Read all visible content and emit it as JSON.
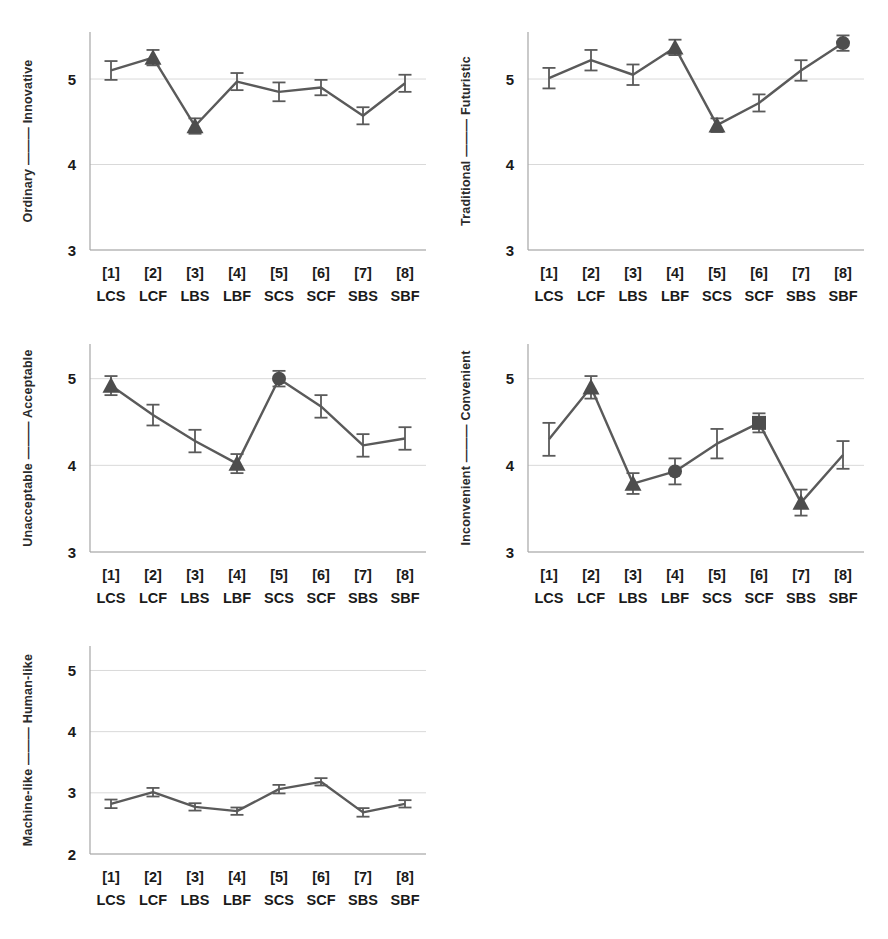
{
  "figure": {
    "title": "",
    "panel_count": 5,
    "accent_color": "#5a5a5a",
    "marker_color": "#4d4d4d",
    "grid_color": "#d9d9d9"
  },
  "conditions": {
    "indices": [
      "[1]",
      "[2]",
      "[3]",
      "[4]",
      "[5]",
      "[6]",
      "[7]",
      "[8]"
    ],
    "codes": [
      "LCS",
      "LCF",
      "LBS",
      "LBF",
      "SCS",
      "SCF",
      "SBS",
      "SBF"
    ]
  },
  "chart_data": [
    {
      "id": "panel-ordinary-innovative",
      "type": "line",
      "title": "",
      "ylabel": "Ordinary ——— Innovative",
      "ylabel_left": "Ordinary",
      "ylabel_right": "Innovative",
      "xlabel": "",
      "categories": [
        "[1] LCS",
        "[2] LCF",
        "[3] LBS",
        "[4] LBF",
        "[5] SCS",
        "[6] SCF",
        "[7] SBS",
        "[8] SBF"
      ],
      "values": [
        5.1,
        5.25,
        4.45,
        4.97,
        4.85,
        4.9,
        4.57,
        4.95
      ],
      "errors": [
        0.11,
        0.09,
        0.09,
        0.1,
        0.11,
        0.09,
        0.1,
        0.1
      ],
      "markers": [
        "none",
        "triangle",
        "triangle",
        "none",
        "none",
        "none",
        "none",
        "none"
      ],
      "ylim": [
        3,
        5.55
      ],
      "yticks": [
        3,
        4,
        5
      ],
      "ytick_labels": [
        "3",
        "4",
        "5"
      ],
      "grid": true,
      "legend": "none"
    },
    {
      "id": "panel-traditional-futuristic",
      "type": "line",
      "title": "",
      "ylabel": "Traditional ——— Futuristic",
      "ylabel_left": "Traditional",
      "ylabel_right": "Futuristic",
      "xlabel": "",
      "categories": [
        "[1] LCS",
        "[2] LCF",
        "[3] LBS",
        "[4] LBF",
        "[5] SCS",
        "[6] SCF",
        "[7] SBS",
        "[8] SBF"
      ],
      "values": [
        5.01,
        5.22,
        5.05,
        5.37,
        4.46,
        4.72,
        5.1,
        5.42
      ],
      "errors": [
        0.12,
        0.12,
        0.12,
        0.09,
        0.08,
        0.1,
        0.12,
        0.09
      ],
      "markers": [
        "none",
        "none",
        "none",
        "triangle",
        "triangle",
        "none",
        "none",
        "circle"
      ],
      "ylim": [
        3,
        5.55
      ],
      "yticks": [
        3,
        4,
        5
      ],
      "ytick_labels": [
        "3",
        "4",
        "5"
      ],
      "grid": true,
      "legend": "none"
    },
    {
      "id": "panel-unacceptable-acceptable",
      "type": "line",
      "title": "",
      "ylabel": "Unacceptable ——— Acceptable",
      "ylabel_left": "Unacceptable",
      "ylabel_right": "Acceptable",
      "xlabel": "",
      "categories": [
        "[1] LCS",
        "[2] LCF",
        "[3] LBS",
        "[4] LBF",
        "[5] SCS",
        "[6] SCF",
        "[7] SBS",
        "[8] SBF"
      ],
      "values": [
        4.92,
        4.58,
        4.28,
        4.02,
        5.0,
        4.68,
        4.23,
        4.31
      ],
      "errors": [
        0.11,
        0.12,
        0.13,
        0.11,
        0.09,
        0.13,
        0.13,
        0.13
      ],
      "markers": [
        "triangle",
        "none",
        "none",
        "triangle",
        "circle",
        "none",
        "none",
        "none"
      ],
      "ylim": [
        3,
        5.4
      ],
      "yticks": [
        3,
        4,
        5
      ],
      "ytick_labels": [
        "3",
        "4",
        "5"
      ],
      "grid": true,
      "legend": "none"
    },
    {
      "id": "panel-inconvenient-convenient",
      "type": "line",
      "title": "",
      "ylabel": "Inconvenient ——— Convenient",
      "ylabel_left": "Inconvenient",
      "ylabel_right": "Convenient",
      "xlabel": "",
      "categories": [
        "[1] LCS",
        "[2] LCF",
        "[3] LBS",
        "[4] LBF",
        "[5] SCS",
        "[6] SCF",
        "[7] SBS",
        "[8] SBF"
      ],
      "values": [
        4.3,
        4.9,
        3.79,
        3.93,
        4.25,
        4.49,
        3.57,
        4.12
      ],
      "errors": [
        0.19,
        0.13,
        0.12,
        0.15,
        0.17,
        0.11,
        0.15,
        0.16
      ],
      "markers": [
        "none",
        "triangle",
        "triangle",
        "circle",
        "none",
        "square",
        "triangle",
        "none"
      ],
      "ylim": [
        3,
        5.4
      ],
      "yticks": [
        3,
        4,
        5
      ],
      "ytick_labels": [
        "3",
        "4",
        "5"
      ],
      "grid": true,
      "legend": "none"
    },
    {
      "id": "panel-machine-human",
      "type": "line",
      "title": "",
      "ylabel": "Machine-like ——— Human-like",
      "ylabel_left": "Machine-like",
      "ylabel_right": "Human-like",
      "xlabel": "",
      "categories": [
        "[1] LCS",
        "[2] LCF",
        "[3] LBS",
        "[4] LBF",
        "[5] SCS",
        "[6] SCF",
        "[7] SBS",
        "[8] SBF"
      ],
      "values": [
        2.82,
        3.01,
        2.77,
        2.7,
        3.06,
        3.18,
        2.68,
        2.82
      ],
      "errors": [
        0.07,
        0.07,
        0.06,
        0.06,
        0.07,
        0.06,
        0.07,
        0.06
      ],
      "markers": [
        "none",
        "none",
        "none",
        "none",
        "none",
        "none",
        "none",
        "none"
      ],
      "ylim": [
        2,
        5.4
      ],
      "yticks": [
        2,
        3,
        4,
        5
      ],
      "ytick_labels": [
        "2",
        "3",
        "4",
        "5"
      ],
      "grid": true,
      "legend": "none"
    }
  ]
}
